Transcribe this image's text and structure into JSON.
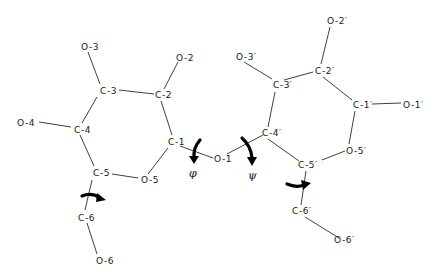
{
  "diagram": {
    "colors": {
      "background": "#ffffff",
      "line": "#2a2a2a",
      "arrow": "#000000",
      "text": "#1a1a1a"
    },
    "atoms": {
      "O3": {
        "label": "O-3",
        "x": 81,
        "y": 47
      },
      "O2": {
        "label": "O-2",
        "x": 176,
        "y": 58
      },
      "C3": {
        "label": "C-3",
        "x": 100,
        "y": 92
      },
      "C2": {
        "label": "C-2",
        "x": 156,
        "y": 95
      },
      "O4": {
        "label": "O-4",
        "x": 17,
        "y": 123
      },
      "C4": {
        "label": "C-4",
        "x": 75,
        "y": 130
      },
      "C1": {
        "label": "C-1",
        "x": 168,
        "y": 143
      },
      "C5": {
        "label": "C-5",
        "x": 94,
        "y": 174
      },
      "O5": {
        "label": "O-5",
        "x": 141,
        "y": 181
      },
      "O1": {
        "label": "O-1",
        "x": 216,
        "y": 159
      },
      "C6": {
        "label": "C-6",
        "x": 80,
        "y": 218
      },
      "O6": {
        "label": "O-6",
        "x": 96,
        "y": 261
      },
      "O2p": {
        "label": "O-2′",
        "x": 326,
        "y": 21
      },
      "O3p": {
        "label": "O-3′",
        "x": 236,
        "y": 57
      },
      "C2p": {
        "label": "C-2′",
        "x": 315,
        "y": 71
      },
      "C3p": {
        "label": "C-3′",
        "x": 273,
        "y": 85
      },
      "C1p": {
        "label": "C-1′",
        "x": 354,
        "y": 105
      },
      "O1p": {
        "label": "O-1′",
        "x": 403,
        "y": 105
      },
      "C4p": {
        "label": "C-4′",
        "x": 264,
        "y": 134
      },
      "O5p": {
        "label": "O-5′",
        "x": 348,
        "y": 151
      },
      "C5p": {
        "label": "C-5′",
        "x": 306,
        "y": 166
      },
      "C6p": {
        "label": "C-6′",
        "x": 300,
        "y": 212
      },
      "O6p": {
        "label": "O-6′",
        "x": 342,
        "y": 240
      }
    },
    "torsion_angles": {
      "phi": {
        "symbol": "φ",
        "x": 193,
        "y": 174
      },
      "psi": {
        "symbol": "ψ",
        "x": 253,
        "y": 176
      }
    }
  }
}
